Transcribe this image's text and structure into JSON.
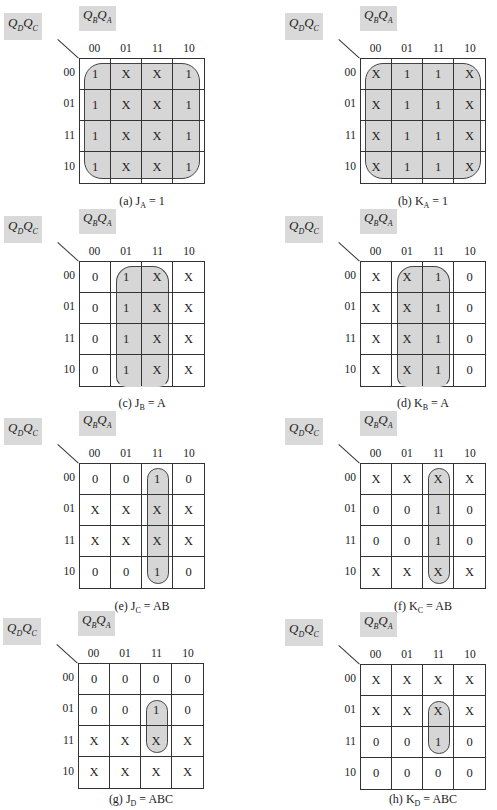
{
  "labels": {
    "row_var": "Q_D Q_C",
    "col_var": "Q_B Q_A",
    "col_headers": [
      "00",
      "01",
      "11",
      "10"
    ],
    "row_headers": [
      "00",
      "01",
      "11",
      "10"
    ]
  },
  "kmaps": [
    {
      "id": "a",
      "caption_prefix": "(a)",
      "func": "J",
      "sub": "A",
      "expr": "= 1",
      "cells": [
        [
          "1",
          "X",
          "X",
          "1"
        ],
        [
          "1",
          "X",
          "X",
          "1"
        ],
        [
          "1",
          "X",
          "X",
          "1"
        ],
        [
          "1",
          "X",
          "X",
          "1"
        ]
      ],
      "loop": {
        "col_start": 0,
        "col_end": 3,
        "row_start": 0,
        "row_end": 3,
        "open_bottom": false
      }
    },
    {
      "id": "b",
      "caption_prefix": "(b)",
      "func": "K",
      "sub": "A",
      "expr": "= 1",
      "cells": [
        [
          "X",
          "1",
          "1",
          "X"
        ],
        [
          "X",
          "1",
          "1",
          "X"
        ],
        [
          "X",
          "1",
          "1",
          "X"
        ],
        [
          "X",
          "1",
          "1",
          "X"
        ]
      ],
      "loop": {
        "col_start": 0,
        "col_end": 3,
        "row_start": 0,
        "row_end": 3,
        "open_bottom": false
      }
    },
    {
      "id": "c",
      "caption_prefix": "(c)",
      "func": "J",
      "sub": "B",
      "expr": "= A",
      "cells": [
        [
          "0",
          "1",
          "X",
          "X"
        ],
        [
          "0",
          "1",
          "X",
          "X"
        ],
        [
          "0",
          "1",
          "X",
          "X"
        ],
        [
          "0",
          "1",
          "X",
          "X"
        ]
      ],
      "loop": {
        "col_start": 1,
        "col_end": 2,
        "row_start": 0,
        "row_end": 3,
        "open_bottom": true
      }
    },
    {
      "id": "d",
      "caption_prefix": "(d)",
      "func": "K",
      "sub": "B",
      "expr": "= A",
      "cells": [
        [
          "X",
          "X",
          "1",
          "0"
        ],
        [
          "X",
          "X",
          "1",
          "0"
        ],
        [
          "X",
          "X",
          "1",
          "0"
        ],
        [
          "X",
          "X",
          "1",
          "0"
        ]
      ],
      "loop": {
        "col_start": 1,
        "col_end": 2,
        "row_start": 0,
        "row_end": 3,
        "open_bottom": true
      }
    },
    {
      "id": "e",
      "caption_prefix": "(e)",
      "func": "J",
      "sub": "C",
      "expr": "= AB",
      "cells": [
        [
          "0",
          "0",
          "1",
          "0"
        ],
        [
          "X",
          "X",
          "X",
          "X"
        ],
        [
          "X",
          "X",
          "X",
          "X"
        ],
        [
          "0",
          "0",
          "1",
          "0"
        ]
      ],
      "loop": {
        "col_start": 2,
        "col_end": 2,
        "row_start": 0,
        "row_end": 3,
        "open_bottom": false
      }
    },
    {
      "id": "f",
      "caption_prefix": "(f)",
      "func": "K",
      "sub": "C",
      "expr": "= AB",
      "cells": [
        [
          "X",
          "X",
          "X",
          "X"
        ],
        [
          "0",
          "0",
          "1",
          "0"
        ],
        [
          "0",
          "0",
          "1",
          "0"
        ],
        [
          "X",
          "X",
          "X",
          "X"
        ]
      ],
      "loop": {
        "col_start": 2,
        "col_end": 2,
        "row_start": 0,
        "row_end": 3,
        "open_bottom": false
      }
    },
    {
      "id": "g",
      "caption_prefix": "(g)",
      "func": "J",
      "sub": "D",
      "expr": "= ABC",
      "cells": [
        [
          "0",
          "0",
          "0",
          "0"
        ],
        [
          "0",
          "0",
          "1",
          "0"
        ],
        [
          "X",
          "X",
          "X",
          "X"
        ],
        [
          "X",
          "X",
          "X",
          "X"
        ]
      ],
      "loop": {
        "col_start": 2,
        "col_end": 2,
        "row_start": 1,
        "row_end": 2,
        "open_bottom": false
      }
    },
    {
      "id": "h",
      "caption_prefix": "(h)",
      "func": "K",
      "sub": "D",
      "expr": "= ABC",
      "cells": [
        [
          "X",
          "X",
          "X",
          "X"
        ],
        [
          "X",
          "X",
          "X",
          "X"
        ],
        [
          "0",
          "0",
          "1",
          "0"
        ],
        [
          "0",
          "0",
          "0",
          "0"
        ]
      ],
      "loop": {
        "col_start": 2,
        "col_end": 2,
        "row_start": 1,
        "row_end": 2,
        "open_bottom": false
      }
    }
  ]
}
